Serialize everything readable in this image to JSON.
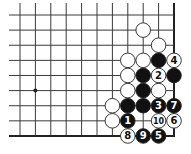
{
  "diagram": {
    "type": "go-board-fragment",
    "corner": "bottom-right",
    "columns": 11,
    "rows": 9,
    "colors": {
      "background": "#ffffff",
      "line": "#3a3a3a",
      "edge": "#222222",
      "black_stone": "#111111",
      "white_stone": "#ffffff",
      "stone_outline": "#222222"
    },
    "star_points": [
      {
        "col": 1,
        "row": 5
      }
    ],
    "stones": [
      {
        "col": 8,
        "row": 1,
        "color": "white",
        "label": ""
      },
      {
        "col": 9,
        "row": 2,
        "color": "white",
        "label": ""
      },
      {
        "col": 7,
        "row": 3,
        "color": "white",
        "label": ""
      },
      {
        "col": 8,
        "row": 3,
        "color": "white",
        "label": ""
      },
      {
        "col": 9,
        "row": 3,
        "color": "black",
        "label": ""
      },
      {
        "col": 10,
        "row": 3,
        "color": "white",
        "label": "4"
      },
      {
        "col": 7,
        "row": 4,
        "color": "white",
        "label": ""
      },
      {
        "col": 8,
        "row": 4,
        "color": "black",
        "label": ""
      },
      {
        "col": 9,
        "row": 4,
        "color": "white",
        "label": "2"
      },
      {
        "col": 10,
        "row": 4,
        "color": "black",
        "label": ""
      },
      {
        "col": 7,
        "row": 5,
        "color": "white",
        "label": ""
      },
      {
        "col": 8,
        "row": 5,
        "color": "black",
        "label": ""
      },
      {
        "col": 9,
        "row": 5,
        "color": "white",
        "label": ""
      },
      {
        "col": 6,
        "row": 6,
        "color": "white",
        "label": ""
      },
      {
        "col": 7,
        "row": 6,
        "color": "black",
        "label": ""
      },
      {
        "col": 8,
        "row": 6,
        "color": "black",
        "label": ""
      },
      {
        "col": 9,
        "row": 6,
        "color": "black",
        "label": "3"
      },
      {
        "col": 10,
        "row": 6,
        "color": "black",
        "label": "7"
      },
      {
        "col": 6,
        "row": 7,
        "color": "white",
        "label": ""
      },
      {
        "col": 7,
        "row": 7,
        "color": "black",
        "label": "1"
      },
      {
        "col": 9,
        "row": 7,
        "color": "white",
        "label": "10"
      },
      {
        "col": 10,
        "row": 7,
        "color": "white",
        "label": "6"
      },
      {
        "col": 7,
        "row": 8,
        "color": "white",
        "label": "8"
      },
      {
        "col": 8,
        "row": 8,
        "color": "black",
        "label": "9"
      },
      {
        "col": 9,
        "row": 8,
        "color": "black",
        "label": "5"
      }
    ],
    "move_sequence": [
      {
        "move": 1,
        "color": "black"
      },
      {
        "move": 2,
        "color": "white"
      },
      {
        "move": 3,
        "color": "black"
      },
      {
        "move": 4,
        "color": "white"
      },
      {
        "move": 5,
        "color": "black"
      },
      {
        "move": 6,
        "color": "white"
      },
      {
        "move": 7,
        "color": "black"
      },
      {
        "move": 8,
        "color": "white"
      },
      {
        "move": 9,
        "color": "black"
      },
      {
        "move": 10,
        "color": "white"
      }
    ]
  }
}
